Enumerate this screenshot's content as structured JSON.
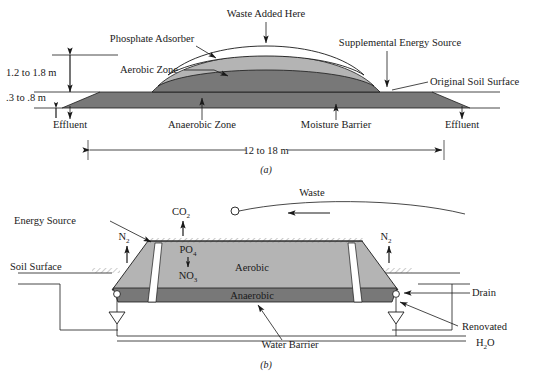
{
  "figure": {
    "panel_a": {
      "caption": "(a)",
      "labels": {
        "waste_added": "Waste Added Here",
        "phosphate_adsorber": "Phosphate Adsorber",
        "supplemental_energy": "Supplemental Energy Source",
        "aerobic_zone": "Aerobic Zone",
        "anaerobic_zone": "Anaerobic Zone",
        "moisture_barrier": "Moisture Barrier",
        "original_soil_surface": "Original Soil Surface",
        "effluent_left": "Effluent",
        "effluent_right": "Effluent"
      },
      "dimensions": {
        "mound_height": "1.2 to 1.8 m",
        "soil_depth": ".3 to .8 m",
        "width": "12 to 18 m"
      }
    },
    "panel_b": {
      "caption": "(b)",
      "labels": {
        "energy_source": "Energy Source",
        "co2": "CO",
        "co2_sub": "2",
        "waste": "Waste",
        "n2_left": "N",
        "n2_left_sub": "2",
        "n2_right": "N",
        "n2_right_sub": "2",
        "po4": "PO",
        "po4_sub": "4",
        "no3": "NO",
        "no3_sub": "3",
        "aerobic": "Aerobic",
        "anaerobic": "Anaerobic",
        "soil_surface": "Soil Surface",
        "drain": "Drain",
        "renovated": "Renovated",
        "renovated_formula": "H",
        "renovated_formula_sub": "2",
        "renovated_formula_tail": "O",
        "water_barrier": "Water Barrier"
      }
    }
  },
  "colors": {
    "aerobic_fill": "#b4b4b4",
    "anaerobic_fill": "#787878",
    "soil_fill": "#787878",
    "white_fill": "#ffffff",
    "line": "#1a1a1a",
    "page_bg": "#ffffff"
  }
}
